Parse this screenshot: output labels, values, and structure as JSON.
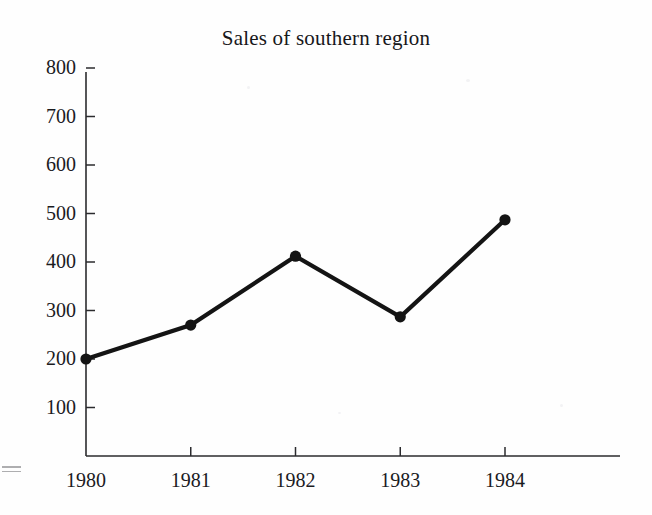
{
  "chart_data": {
    "type": "line",
    "title": "Sales of southern region",
    "xlabel": "",
    "ylabel": "",
    "categories": [
      "1980",
      "1981",
      "1982",
      "1983",
      "1984"
    ],
    "values": [
      200,
      270,
      412,
      287,
      487
    ],
    "series": [
      {
        "name": "Sales of southern region",
        "values": [
          200,
          270,
          412,
          287,
          487
        ]
      }
    ],
    "yticks": [
      100,
      200,
      300,
      400,
      500,
      600,
      700,
      800
    ],
    "ytick_labels": [
      "100",
      "200",
      "300",
      "400",
      "500",
      "600",
      "700",
      "800"
    ],
    "xtick_labels": [
      "1980",
      "1981",
      "1982",
      "1983",
      "1984"
    ],
    "ylim": [
      0,
      800
    ],
    "grid": false,
    "legend": "none",
    "marker": "filled-circle",
    "line_color": "#141414",
    "marker_color": "#141414",
    "axis_color": "#2b2b2e",
    "background_color": "#fefefe"
  },
  "artifacts": {
    "left_margin_mark": "equals-sign-scan-artifact"
  }
}
